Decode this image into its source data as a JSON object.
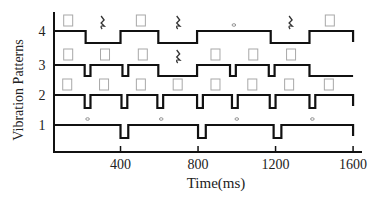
{
  "chart_data": {
    "type": "line",
    "subtype": "timing-diagram",
    "title": "",
    "xlabel": "Time(ms)",
    "ylabel": "Vibration Patterns",
    "xlim": [
      60,
      1600
    ],
    "x_ticks": [
      400,
      800,
      1200,
      1600
    ],
    "y_ticks": [
      1,
      2,
      3,
      4
    ],
    "grid": false,
    "legend": null,
    "series": [
      {
        "name": "Pattern 1",
        "level": 1,
        "segments": [
          {
            "state": "on",
            "start": 60,
            "end": 400
          },
          {
            "state": "off",
            "start": 400,
            "end": 440
          },
          {
            "state": "on",
            "start": 440,
            "end": 800
          },
          {
            "state": "off",
            "start": 800,
            "end": 840
          },
          {
            "state": "on",
            "start": 840,
            "end": 1190
          },
          {
            "state": "off",
            "start": 1190,
            "end": 1230
          },
          {
            "state": "on",
            "start": 1230,
            "end": 1600
          }
        ],
        "markers": [
          {
            "symbol": "whole-note",
            "x": 230
          },
          {
            "symbol": "whole-note",
            "x": 610
          },
          {
            "symbol": "whole-note",
            "x": 1000
          },
          {
            "symbol": "whole-note",
            "x": 1390
          }
        ]
      },
      {
        "name": "Pattern 2",
        "level": 2,
        "segments": [
          {
            "state": "on",
            "start": 60,
            "end": 215
          },
          {
            "state": "off",
            "start": 215,
            "end": 245
          },
          {
            "state": "on",
            "start": 245,
            "end": 405
          },
          {
            "state": "off",
            "start": 405,
            "end": 435
          },
          {
            "state": "on",
            "start": 435,
            "end": 590
          },
          {
            "state": "off",
            "start": 590,
            "end": 620
          },
          {
            "state": "on",
            "start": 620,
            "end": 795
          },
          {
            "state": "off",
            "start": 795,
            "end": 825
          },
          {
            "state": "on",
            "start": 825,
            "end": 975
          },
          {
            "state": "off",
            "start": 975,
            "end": 1005
          },
          {
            "state": "on",
            "start": 1005,
            "end": 1170
          },
          {
            "state": "off",
            "start": 1170,
            "end": 1200
          },
          {
            "state": "on",
            "start": 1200,
            "end": 1375
          },
          {
            "state": "off",
            "start": 1375,
            "end": 1405
          },
          {
            "state": "on",
            "start": 1405,
            "end": 1600
          }
        ],
        "markers": [
          {
            "symbol": "quarter-box",
            "x": 125
          },
          {
            "symbol": "quarter-box",
            "x": 315
          },
          {
            "symbol": "quarter-box",
            "x": 505
          },
          {
            "symbol": "quarter-box",
            "x": 695
          },
          {
            "symbol": "quarter-box",
            "x": 890
          },
          {
            "symbol": "quarter-box",
            "x": 1080
          },
          {
            "symbol": "quarter-box",
            "x": 1270
          },
          {
            "symbol": "quarter-box",
            "x": 1475
          }
        ]
      },
      {
        "name": "Pattern 3",
        "level": 3,
        "segments": [
          {
            "state": "on",
            "start": 60,
            "end": 215
          },
          {
            "state": "off",
            "start": 215,
            "end": 245
          },
          {
            "state": "on",
            "start": 245,
            "end": 410
          },
          {
            "state": "off",
            "start": 410,
            "end": 440
          },
          {
            "state": "on",
            "start": 440,
            "end": 595
          },
          {
            "state": "off",
            "start": 595,
            "end": 795
          },
          {
            "state": "on",
            "start": 795,
            "end": 965
          },
          {
            "state": "off",
            "start": 965,
            "end": 995
          },
          {
            "state": "on",
            "start": 995,
            "end": 1165
          },
          {
            "state": "off",
            "start": 1165,
            "end": 1195
          },
          {
            "state": "on",
            "start": 1195,
            "end": 1375
          },
          {
            "state": "off",
            "start": 1375,
            "end": 1600
          }
        ],
        "markers": [
          {
            "symbol": "quarter-box",
            "x": 130
          },
          {
            "symbol": "quarter-box",
            "x": 320
          },
          {
            "symbol": "quarter-box",
            "x": 515
          },
          {
            "symbol": "quarter-rest",
            "x": 695
          },
          {
            "symbol": "quarter-box",
            "x": 890
          },
          {
            "symbol": "quarter-box",
            "x": 1085
          },
          {
            "symbol": "quarter-box",
            "x": 1280
          }
        ]
      },
      {
        "name": "Pattern 4",
        "level": 4,
        "segments": [
          {
            "state": "on",
            "start": 60,
            "end": 220
          },
          {
            "state": "off",
            "start": 220,
            "end": 400
          },
          {
            "state": "on",
            "start": 400,
            "end": 595
          },
          {
            "state": "off",
            "start": 595,
            "end": 795
          },
          {
            "state": "on",
            "start": 795,
            "end": 1175
          },
          {
            "state": "off",
            "start": 1175,
            "end": 1375
          },
          {
            "state": "on",
            "start": 1375,
            "end": 1600
          }
        ],
        "markers": [
          {
            "symbol": "quarter-box",
            "x": 130
          },
          {
            "symbol": "quarter-rest",
            "x": 305
          },
          {
            "symbol": "quarter-box",
            "x": 505
          },
          {
            "symbol": "quarter-rest",
            "x": 695
          },
          {
            "symbol": "whole-note",
            "x": 985
          },
          {
            "symbol": "quarter-rest",
            "x": 1275
          },
          {
            "symbol": "quarter-box",
            "x": 1480
          }
        ]
      }
    ]
  },
  "axes": {
    "x_label": "Time(ms)",
    "y_label": "Vibration Patterns",
    "x_tick_labels": [
      "400",
      "800",
      "1200",
      "1600"
    ],
    "y_tick_labels": [
      "1",
      "2",
      "3",
      "4"
    ]
  }
}
